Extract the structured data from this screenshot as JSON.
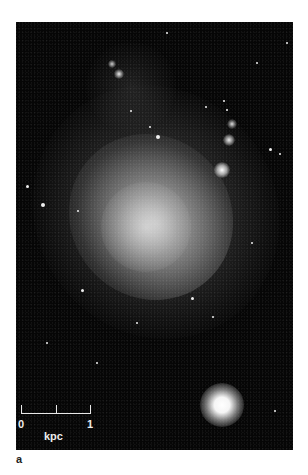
{
  "figure": {
    "panel_label": "a",
    "image_description": "Astronomical image of an irregular dwarf galaxy with a bright foreground star in the lower right",
    "scale_bar": {
      "tick_labels": [
        "0",
        "1"
      ],
      "unit_label": "kpc"
    },
    "colors": {
      "background": "#060606",
      "galaxy_core": "#cfcfcf",
      "scale_bar": "#e8e8e8",
      "page": "#ffffff"
    }
  }
}
